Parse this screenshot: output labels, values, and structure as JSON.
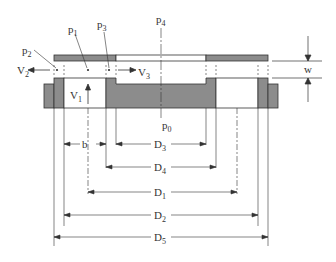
{
  "labels": {
    "p0": {
      "base": "p",
      "sub": "0"
    },
    "p1": {
      "base": "p",
      "sub": "1"
    },
    "p2": {
      "base": "p",
      "sub": "2"
    },
    "p3": {
      "base": "p",
      "sub": "3"
    },
    "p4": {
      "base": "p",
      "sub": "4"
    },
    "v1": {
      "base": "V",
      "sub": "1"
    },
    "v2": {
      "base": "V",
      "sub": "2"
    },
    "v3": {
      "base": "V",
      "sub": "3"
    },
    "w": "w",
    "b": "b",
    "d1": {
      "base": "D",
      "sub": "1"
    },
    "d2": {
      "base": "D",
      "sub": "2"
    },
    "d3": {
      "base": "D",
      "sub": "3"
    },
    "d4": {
      "base": "D",
      "sub": "4"
    },
    "d5": {
      "base": "D",
      "sub": "5"
    }
  },
  "colors": {
    "fill_gray": "#8c8c8c",
    "line": "#333333",
    "background": "#ffffff"
  }
}
